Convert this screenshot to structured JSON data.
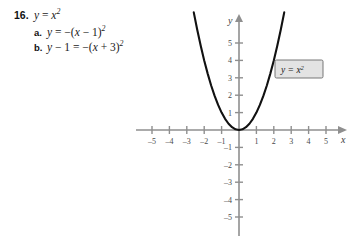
{
  "problem": {
    "number": "16.",
    "main_equation": {
      "lhs": "y",
      "rel": "=",
      "rhs_base": "x",
      "rhs_exp": "2",
      "plain": "y = x²"
    },
    "parts": [
      {
        "label": "a.",
        "plain": "y = −(x − 1)²",
        "lhs": "y",
        "rel": "=",
        "sign": "−(",
        "var": "x",
        "op": "−",
        "const": "1",
        "close": ")",
        "exp": "2"
      },
      {
        "label": "b.",
        "plain": "y − 1 = −(x + 3)²",
        "lhs": "y",
        "lhs_op": "−",
        "lhs_const": "1",
        "rel": "=",
        "sign": "−(",
        "var": "x",
        "op": "+",
        "const": "3",
        "close": ")",
        "exp": "2"
      }
    ]
  },
  "chart_data": {
    "type": "line",
    "title": "",
    "function_label": "y = x²",
    "function_label_parts": {
      "lhs": "y",
      "rel": "=",
      "base": "x",
      "exp": "2"
    },
    "xlabel": "x",
    "ylabel": "y",
    "xlim": [
      -6.2,
      6.4
    ],
    "ylim": [
      -5.9,
      6.4
    ],
    "grid": false,
    "legend_position": "inline-right",
    "x_ticks": [
      -5,
      -4,
      -3,
      -2,
      -1,
      1,
      2,
      3,
      4,
      5
    ],
    "x_tick_labels": [
      "–5",
      "–4",
      "–3",
      "–2",
      "–1",
      "1",
      "2",
      "3",
      "4",
      "5"
    ],
    "y_ticks": [
      5,
      4,
      3,
      2,
      1,
      -1,
      -2,
      -3,
      -4,
      -5
    ],
    "y_tick_labels": [
      "5",
      "4",
      "3",
      "2",
      "1",
      "–1",
      "–2",
      "–3",
      "–4",
      "–5"
    ],
    "series": [
      {
        "name": "y = x²",
        "color": "#111111",
        "x": [
          -2.6,
          -2.4,
          -2.2,
          -2.0,
          -1.8,
          -1.6,
          -1.4,
          -1.2,
          -1.0,
          -0.8,
          -0.6,
          -0.4,
          -0.2,
          0.0,
          0.2,
          0.4,
          0.6,
          0.8,
          1.0,
          1.2,
          1.4,
          1.6,
          1.8,
          2.0,
          2.2,
          2.4,
          2.6
        ],
        "y": [
          6.76,
          5.76,
          4.84,
          4.0,
          3.24,
          2.56,
          1.96,
          1.44,
          1.0,
          0.64,
          0.36,
          0.16,
          0.04,
          0.0,
          0.04,
          0.16,
          0.36,
          0.64,
          1.0,
          1.44,
          1.96,
          2.56,
          3.24,
          4.0,
          4.84,
          5.76,
          6.76
        ]
      }
    ],
    "axis_color": "#8f8f8f",
    "curve_color": "#111111",
    "label_box_fill": "#e3e3e3",
    "label_box_stroke": "#6a6a6a"
  }
}
